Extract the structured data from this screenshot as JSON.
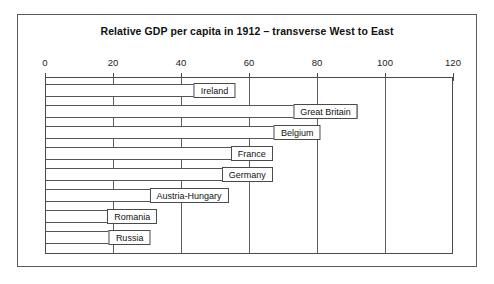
{
  "chart_data": {
    "type": "bar",
    "orientation": "horizontal",
    "title": "Relative GDP per capita in 1912 – transverse West to East",
    "xlabel": "",
    "ylabel": "",
    "xlim": [
      0,
      120
    ],
    "grid": true,
    "legend": "none",
    "ticks": [
      "0",
      "20",
      "40",
      "60",
      "80",
      "100",
      "120"
    ],
    "tick_values": [
      0,
      20,
      40,
      60,
      80,
      100,
      120
    ],
    "categories": [
      "Ireland",
      "Great Britain",
      "Belgium",
      "France",
      "Germany",
      "Austria-Hungary",
      "Romania",
      "Russia"
    ],
    "values": [
      56,
      92,
      81,
      67,
      67,
      54,
      33,
      31
    ]
  },
  "bars": [
    {
      "label": "Ireland",
      "value": 56
    },
    {
      "label": "Great Britain",
      "value": 92
    },
    {
      "label": "Belgium",
      "value": 81
    },
    {
      "label": "France",
      "value": 67
    },
    {
      "label": "Germany",
      "value": 67
    },
    {
      "label": "Austria-Hungary",
      "value": 54
    },
    {
      "label": "Romania",
      "value": 33
    },
    {
      "label": "Russia",
      "value": 31
    }
  ],
  "colors": {
    "bar_fill": "#ffffff",
    "bar_stroke": "#555555",
    "frame": "#5a5a5a",
    "text": "#111111",
    "background": "#ffffff"
  }
}
